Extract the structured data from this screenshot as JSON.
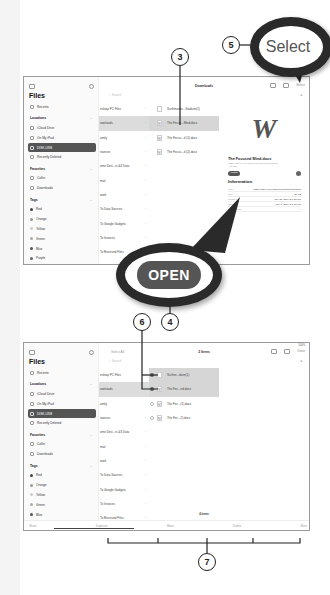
{
  "top_screen": {
    "status_left": "3:51 PM  Sun Sep 8",
    "sidebar": {
      "title": "Files",
      "items": [
        {
          "label": "Recents",
          "type": "item",
          "icon": "clock-icon"
        },
        {
          "label": "Locations",
          "type": "header"
        },
        {
          "label": "iCloud Drive",
          "type": "item",
          "icon": "cloud-icon"
        },
        {
          "label": "On My iPad",
          "type": "item",
          "icon": "ipad-icon"
        },
        {
          "label": "DISK-USB",
          "type": "item",
          "icon": "drive-icon",
          "active": true
        },
        {
          "label": "Recently Deleted",
          "type": "item",
          "icon": "trash-icon"
        },
        {
          "label": "Favorites",
          "type": "header"
        },
        {
          "label": "Collin",
          "type": "item",
          "icon": "folder-icon"
        },
        {
          "label": "Downloads",
          "type": "item",
          "icon": "download-icon"
        },
        {
          "label": "Tags",
          "type": "header"
        },
        {
          "label": "Red",
          "type": "tag",
          "color": "#444444"
        },
        {
          "label": "Orange",
          "type": "tag",
          "color": "#999999"
        },
        {
          "label": "Yellow",
          "type": "tag",
          "color": "#cccccc"
        },
        {
          "label": "Green",
          "type": "tag",
          "color": "#aaaaaa"
        },
        {
          "label": "Blue",
          "type": "tag",
          "color": "#555555"
        },
        {
          "label": "Purple",
          "type": "tag",
          "color": "#666666"
        }
      ]
    },
    "nav_title": "Downloads",
    "select_label": "Select",
    "search_placeholder": "Search",
    "column1": [
      "esktop PC Files",
      "ownloads",
      "amily",
      "inances",
      "ome Desi...ts &3 Data",
      "mail",
      "work",
      "To Data Sources",
      "To Google Gadgets",
      "To Invoices",
      "To Received Files",
      "To Scans"
    ],
    "column1_selected": 1,
    "column2": [
      {
        "name": "Surfinnowlo...Stadium(1)",
        "icon": ""
      },
      {
        "name": "The Focus...Mind.docx",
        "icon": "W"
      },
      {
        "name": "The Focus...d (1).docx",
        "icon": "W"
      },
      {
        "name": "The Focus...d (2).docx",
        "icon": "W"
      }
    ],
    "column2_selected": 1,
    "preview": {
      "big_glyph": "W",
      "file_name": "The Focused Mind.docx",
      "file_subtitle": "Office Open XML word processing document · 26 KB",
      "open_label": "OPEN",
      "info_title": "Information",
      "info": [
        {
          "label": "Kind",
          "value": "Office Open XML word processing document"
        },
        {
          "label": "Size",
          "value": "26 KB"
        },
        {
          "label": "Created",
          "value": "July 21, 2019 at 9:28 PM"
        },
        {
          "label": "Modified",
          "value": "May 8, 2019 at 9:58 PM"
        },
        {
          "label": "Last opened",
          "value": "--"
        }
      ]
    }
  },
  "bottom_screen": {
    "status_left": "3:52 PM  Sun Sep 8",
    "status_right": "100%",
    "select_all_label": "Select All",
    "nav_title": "2 Items",
    "done_label": "Done",
    "column2": [
      {
        "name": "Surfinn...dium(1)",
        "icon": "",
        "checked": true
      },
      {
        "name": "The Foc...nd.docx",
        "icon": "W",
        "checked": true
      },
      {
        "name": "The Foc...(1).docx",
        "icon": "W",
        "checked": false
      },
      {
        "name": "The Foc...2).docx",
        "icon": "W",
        "checked": false
      }
    ],
    "items_count": "4 items",
    "toolbar": [
      "Share",
      "Duplicate",
      "Move",
      "Delete",
      "More"
    ]
  },
  "callouts": {
    "c3": "3",
    "c4": "4",
    "c5": "5",
    "c6": "6",
    "c7": "7",
    "magnified_select": "Select",
    "magnified_open": "OPEN"
  }
}
